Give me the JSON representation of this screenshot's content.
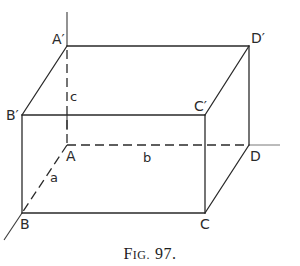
{
  "figure": {
    "caption": "FIG. 97.",
    "caption_parts": {
      "f": "F",
      "ig": "IG.",
      "num": "97."
    },
    "type": "rectangular box (cuboid) in oblique projection",
    "vertices": {
      "A": "A",
      "B": "B",
      "C": "C",
      "D": "D",
      "A_prime": "A′",
      "B_prime": "B′",
      "C_prime": "C′",
      "D_prime": "D′"
    },
    "dimensions": {
      "a": "a",
      "b": "b",
      "c": "c"
    },
    "edges": {
      "visible": [
        "A′D′",
        "B′C′",
        "A′B′",
        "D′C′",
        "BC",
        "B′B",
        "C′C",
        "D′D",
        "CD"
      ],
      "hidden": [
        "AB",
        "AD",
        "AA′"
      ]
    },
    "colors": {
      "ink": "#2a2a2a",
      "paper": "#ffffff"
    }
  }
}
